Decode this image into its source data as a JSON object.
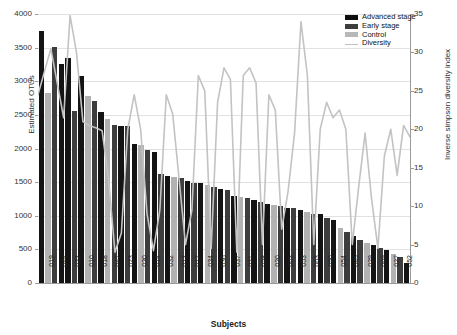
{
  "chart_data": {
    "type": "bar",
    "title": "",
    "xlabel": "Subjects",
    "ylabel": "Estimated OTUs",
    "ylabel_secondary": "Inverse simpson diversity index",
    "ylim": [
      0,
      4000
    ],
    "ylim_secondary": [
      0,
      35
    ],
    "yticks": [
      0,
      500,
      1000,
      1500,
      2000,
      2500,
      3000,
      3500,
      4000
    ],
    "yticks_secondary": [
      0,
      5,
      10,
      15,
      20,
      25,
      30,
      35
    ],
    "grid": true,
    "legend_position": "top-right",
    "legend": [
      "Advanced stage",
      "Early stage",
      "Control",
      "Diversity"
    ],
    "categories": [
      "019",
      "044",
      "022",
      "010",
      "018",
      "047",
      "023",
      "030",
      "014",
      "032",
      "012",
      "017",
      "034",
      "036",
      "037",
      "021",
      "058",
      "020",
      "003",
      "053",
      "063",
      "050",
      "054",
      "045",
      "029",
      "069",
      "027",
      "052"
    ],
    "series": [
      {
        "name": "Estimated OTUs",
        "axis": "left",
        "values": [
          3750,
          3500,
          3340,
          3090,
          2790,
          2700,
          2540,
          2340,
          2330,
          2050,
          1980,
          1950,
          1620,
          1580,
          1510,
          1490,
          1480,
          1430,
          1400,
          1280,
          1240,
          1180,
          1150,
          1110,
          1060,
          1020,
          940,
          900
        ],
        "groups": [
          "advanced",
          "early",
          "advanced",
          "advanced",
          "early",
          "control",
          "early",
          "advanced",
          "early",
          "advanced",
          "early",
          "advanced",
          "advanced",
          "early",
          "advanced",
          "control",
          "advanced",
          "early",
          "advanced",
          "early",
          "advanced",
          "control",
          "advanced",
          "early",
          "advanced",
          "early",
          "advanced",
          "early"
        ]
      },
      {
        "name": "Diversity",
        "axis": "right",
        "values": [
          24.5,
          30.5,
          21.0,
          35.0,
          20.5,
          20.0,
          4.0,
          6.0,
          9.5,
          24.5,
          5.0,
          9.5,
          4.0,
          23.5,
          27.0,
          5.5,
          7.0,
          28.0,
          5.0,
          21.5,
          4.5,
          12.0,
          34.0,
          5.0,
          8.5,
          24.5,
          19.5,
          5.0
        ]
      }
    ],
    "bar_values_full": [
      3750,
      3505,
      3340,
      3085,
      2790,
      2695,
      2540,
      2345,
      2330,
      2050,
      1985,
      1950,
      1620,
      1580,
      1515,
      1490,
      1480,
      1430,
      1400,
      1285,
      1240,
      1180,
      1150,
      1110,
      1060,
      1020,
      940,
      900
    ],
    "n_bars": 56,
    "bars_detail": [
      {
        "v": 3750,
        "g": "advanced"
      },
      {
        "v": 2830,
        "g": "control"
      },
      {
        "v": 3505,
        "g": "early"
      },
      {
        "v": 3250,
        "g": "advanced"
      },
      {
        "v": 3340,
        "g": "advanced"
      },
      {
        "v": 2560,
        "g": "early"
      },
      {
        "v": 3085,
        "g": "advanced"
      },
      {
        "v": 2780,
        "g": "control"
      },
      {
        "v": 2700,
        "g": "early"
      },
      {
        "v": 2540,
        "g": "advanced"
      },
      {
        "v": 2440,
        "g": "control"
      },
      {
        "v": 2350,
        "g": "early"
      },
      {
        "v": 2340,
        "g": "advanced"
      },
      {
        "v": 2330,
        "g": "early"
      },
      {
        "v": 2060,
        "g": "advanced"
      },
      {
        "v": 2050,
        "g": "control"
      },
      {
        "v": 1980,
        "g": "early"
      },
      {
        "v": 1950,
        "g": "advanced"
      },
      {
        "v": 1620,
        "g": "early"
      },
      {
        "v": 1590,
        "g": "advanced"
      },
      {
        "v": 1580,
        "g": "control"
      },
      {
        "v": 1560,
        "g": "early"
      },
      {
        "v": 1510,
        "g": "advanced"
      },
      {
        "v": 1490,
        "g": "early"
      },
      {
        "v": 1480,
        "g": "advanced"
      },
      {
        "v": 1460,
        "g": "control"
      },
      {
        "v": 1430,
        "g": "early"
      },
      {
        "v": 1400,
        "g": "advanced"
      },
      {
        "v": 1380,
        "g": "early"
      },
      {
        "v": 1300,
        "g": "advanced"
      },
      {
        "v": 1285,
        "g": "control"
      },
      {
        "v": 1270,
        "g": "early"
      },
      {
        "v": 1240,
        "g": "advanced"
      },
      {
        "v": 1200,
        "g": "early"
      },
      {
        "v": 1180,
        "g": "advanced"
      },
      {
        "v": 1160,
        "g": "control"
      },
      {
        "v": 1150,
        "g": "early"
      },
      {
        "v": 1120,
        "g": "advanced"
      },
      {
        "v": 1110,
        "g": "early"
      },
      {
        "v": 1080,
        "g": "advanced"
      },
      {
        "v": 1060,
        "g": "control"
      },
      {
        "v": 1030,
        "g": "early"
      },
      {
        "v": 1020,
        "g": "advanced"
      },
      {
        "v": 960,
        "g": "early"
      },
      {
        "v": 940,
        "g": "advanced"
      },
      {
        "v": 820,
        "g": "control"
      },
      {
        "v": 760,
        "g": "early"
      },
      {
        "v": 700,
        "g": "advanced"
      },
      {
        "v": 640,
        "g": "early"
      },
      {
        "v": 600,
        "g": "control"
      },
      {
        "v": 560,
        "g": "advanced"
      },
      {
        "v": 520,
        "g": "early"
      },
      {
        "v": 490,
        "g": "advanced"
      },
      {
        "v": 430,
        "g": "control"
      },
      {
        "v": 380,
        "g": "early"
      },
      {
        "v": 300,
        "g": "advanced"
      }
    ],
    "diversity_points": [
      24.5,
      27.5,
      30.5,
      26.0,
      21.5,
      34.8,
      30.0,
      21.0,
      20.5,
      20.2,
      19.8,
      13.5,
      4.0,
      6.5,
      20.0,
      24.5,
      20.0,
      9.0,
      4.2,
      9.5,
      24.5,
      22.0,
      13.5,
      5.0,
      9.5,
      27.0,
      25.0,
      4.5,
      23.5,
      28.0,
      26.5,
      4.0,
      27.0,
      28.0,
      26.0,
      5.0,
      24.5,
      22.5,
      7.0,
      12.0,
      19.5,
      34.0,
      27.0,
      5.0,
      20.0,
      23.5,
      21.5,
      22.5,
      20.0,
      5.0,
      12.5,
      19.5,
      11.0,
      4.5,
      16.5,
      20.0,
      14.0,
      20.5,
      19.0
    ]
  },
  "colors": {
    "advanced": "#141414",
    "early": "#3d3d3d",
    "control": "#b2b2b2",
    "diversity_line": "#c3c3c3",
    "grid": "#e2e2e2",
    "axis": "#9a9a9a"
  }
}
